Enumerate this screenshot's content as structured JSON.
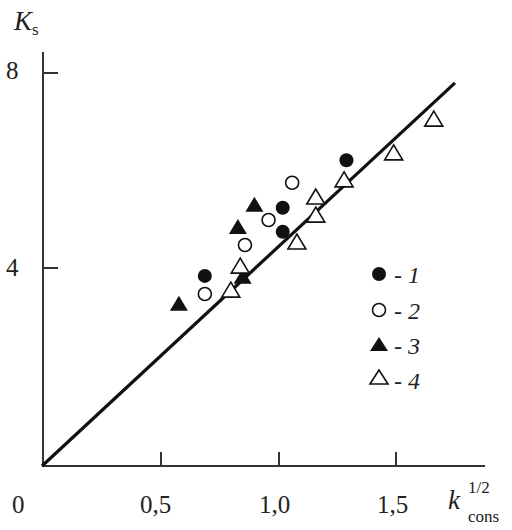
{
  "chart_data": {
    "type": "scatter",
    "title": "",
    "xlabel": "k_cons^1/2",
    "ylabel": "K_s",
    "xlim": [
      0,
      1.8
    ],
    "ylim": [
      0,
      8.5
    ],
    "x_ticks": [
      "0",
      "0,5",
      "1,0",
      "1,5"
    ],
    "y_ticks": [
      "4",
      "8"
    ],
    "grid": false,
    "legend_position": "right-inside",
    "series": [
      {
        "name": "1",
        "marker": "filled-circle",
        "points": [
          [
            0.69,
            3.88
          ],
          [
            1.02,
            5.27
          ],
          [
            1.02,
            4.78
          ],
          [
            1.29,
            6.24
          ]
        ]
      },
      {
        "name": "2",
        "marker": "open-circle",
        "points": [
          [
            0.69,
            3.51
          ],
          [
            0.86,
            4.51
          ],
          [
            0.96,
            5.02
          ],
          [
            1.06,
            5.78
          ]
        ]
      },
      {
        "name": "3",
        "marker": "filled-triangle",
        "points": [
          [
            0.58,
            3.31
          ],
          [
            0.83,
            4.88
          ],
          [
            0.85,
            3.86
          ],
          [
            0.9,
            5.33
          ]
        ]
      },
      {
        "name": "4",
        "marker": "open-triangle",
        "points": [
          [
            0.8,
            3.59
          ],
          [
            0.84,
            4.08
          ],
          [
            1.08,
            4.57
          ],
          [
            1.16,
            5.12
          ],
          [
            1.16,
            5.49
          ],
          [
            1.28,
            5.84
          ],
          [
            1.49,
            6.39
          ],
          [
            1.66,
            7.08
          ]
        ]
      }
    ],
    "fit_line": {
      "x": [
        0,
        1.75
      ],
      "y": [
        0,
        7.82
      ]
    }
  },
  "labels": {
    "y_axis_main": "K",
    "y_axis_sub": "s",
    "x_axis_main": "k",
    "x_axis_sup": "1/2",
    "x_axis_sub": "cons",
    "tick_x_0": "0",
    "tick_x_05": "0,5",
    "tick_x_10": "1,0",
    "tick_x_15": "1,5",
    "tick_y_4": "4",
    "tick_y_8": "8",
    "legend_1": "- 1",
    "legend_2": "- 2",
    "legend_3": "- 3",
    "legend_4": "- 4"
  }
}
